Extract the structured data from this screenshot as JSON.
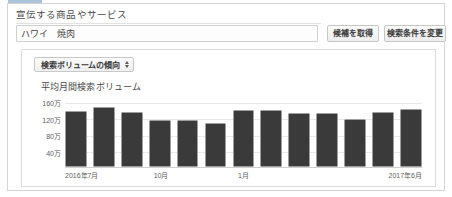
{
  "form": {
    "label": "宣伝する商品やサービス",
    "input_value": "ハワイ　焼肉",
    "input_placeholder": "",
    "fetch_button": "候補を取得",
    "change_button": "検索条件を変更"
  },
  "panel": {
    "metric_select": "検索ボリュームの傾向",
    "chart_title": "平均月間検索ボリューム"
  },
  "colors": {
    "bar": "#3a3a3a",
    "grid": "#e8e8e8",
    "border": "#d4d4d4",
    "accent": "#a9c3dd"
  },
  "chart_data": {
    "type": "bar",
    "title": "平均月間検索ボリューム",
    "xlabel": "",
    "ylabel": "",
    "grid": true,
    "legend": "none",
    "ylim": [
      0,
      1800000
    ],
    "yticks": [
      400000,
      800000,
      1200000,
      1600000
    ],
    "ytick_labels": [
      "40万",
      "80万",
      "120万",
      "160万"
    ],
    "categories": [
      "2016年7月",
      "2016年8月",
      "2016年9月",
      "2016年10月",
      "2016年11月",
      "2016年12月",
      "2017年1月",
      "2017年2月",
      "2017年3月",
      "2017年4月",
      "2017年5月",
      "2017年6月",
      "2017年7月"
    ],
    "xtick_labels": [
      "2016年7月",
      "10月",
      "1月",
      "2017年6月"
    ],
    "xtick_indices": [
      0,
      3,
      6,
      12
    ],
    "values": [
      1400000,
      1510000,
      1380000,
      1180000,
      1180000,
      1090000,
      1420000,
      1420000,
      1360000,
      1360000,
      1200000,
      1380000,
      1460000
    ]
  }
}
